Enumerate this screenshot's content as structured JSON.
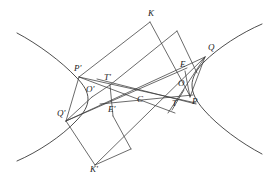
{
  "figure": {
    "kind": "geometry-diagram",
    "background_color": "#ffffff",
    "stroke_color": "#3a3a3a",
    "label_color": "#1c1c1c",
    "width": 275,
    "height": 184
  },
  "labels": [
    {
      "id": "K",
      "text": "K",
      "x": 148,
      "y": 16
    },
    {
      "id": "Q",
      "text": "Q",
      "x": 208,
      "y": 50
    },
    {
      "id": "E",
      "text": "E",
      "x": 180,
      "y": 67
    },
    {
      "id": "P-prime",
      "text": "P'",
      "x": 74,
      "y": 71
    },
    {
      "id": "T-prime",
      "text": "T'",
      "x": 104,
      "y": 80
    },
    {
      "id": "O",
      "text": "O",
      "x": 178,
      "y": 86
    },
    {
      "id": "O-prime",
      "text": "O'",
      "x": 86,
      "y": 92
    },
    {
      "id": "C",
      "text": "C",
      "x": 137,
      "y": 102
    },
    {
      "id": "T",
      "text": "T",
      "x": 172,
      "y": 106
    },
    {
      "id": "P",
      "text": "P",
      "x": 192,
      "y": 104
    },
    {
      "id": "E-prime",
      "text": "E'",
      "x": 108,
      "y": 112
    },
    {
      "id": "Q-prime",
      "text": "Q'",
      "x": 57,
      "y": 116
    },
    {
      "id": "K-prime",
      "text": "K'",
      "x": 90,
      "y": 172
    }
  ],
  "points": {
    "K": {
      "x": 150,
      "y": 22
    },
    "Q": {
      "x": 205,
      "y": 57
    },
    "E": {
      "x": 185,
      "y": 71
    },
    "P_prime": {
      "x": 79,
      "y": 77
    },
    "T_prime": {
      "x": 110,
      "y": 85
    },
    "O": {
      "x": 184,
      "y": 90
    },
    "O_prime": {
      "x": 92,
      "y": 97
    },
    "C": {
      "x": 140,
      "y": 96
    },
    "T": {
      "x": 172,
      "y": 110
    },
    "P": {
      "x": 190,
      "y": 96
    },
    "E_prime": {
      "x": 113,
      "y": 116
    },
    "Q_prime": {
      "x": 66,
      "y": 121
    },
    "K_prime": {
      "x": 95,
      "y": 165
    }
  },
  "curves": {
    "left_branch_label": "left hyperbola branch",
    "right_branch_label": "right hyperbola branch"
  }
}
